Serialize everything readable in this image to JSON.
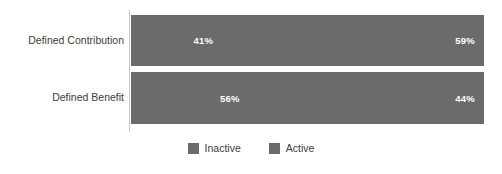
{
  "chart_data": {
    "type": "bar",
    "subtype": "stacked-horizontal-100-percent",
    "title": "",
    "subtitle": "",
    "xlabel": "",
    "ylabel": "",
    "xlim": [
      0,
      100
    ],
    "grid": false,
    "legend_position": "bottom-center",
    "categories": [
      "Defined Contribution",
      "Defined Benefit"
    ],
    "series": [
      {
        "name": "Inactive",
        "color": "#6b6b6b",
        "values": [
          41,
          56
        ],
        "labels": [
          "41%",
          "56%"
        ]
      },
      {
        "name": "Active",
        "color": "#6b6b6b",
        "values": [
          59,
          44
        ],
        "labels": [
          "59%",
          "44%"
        ]
      }
    ]
  },
  "axis": {
    "line_color": "#c9c9c9"
  },
  "category_labels": [
    {
      "text": "Defined Contribution"
    },
    {
      "text": "Defined Benefit"
    }
  ],
  "bars": [
    {
      "category": "Defined Contribution",
      "segments": [
        {
          "series": "Inactive",
          "value": 41,
          "label": "41%"
        },
        {
          "series": "Active",
          "value": 59,
          "label": "59%"
        }
      ]
    },
    {
      "category": "Defined Benefit",
      "segments": [
        {
          "series": "Inactive",
          "value": 56,
          "label": "56%"
        },
        {
          "series": "Active",
          "value": 44,
          "label": "44%"
        }
      ]
    }
  ],
  "legend": {
    "items": [
      {
        "label": "Inactive",
        "color": "#6b6b6b",
        "swatch_icon": "square-swatch-icon"
      },
      {
        "label": "Active",
        "color": "#6b6b6b",
        "swatch_icon": "square-swatch-icon"
      }
    ]
  },
  "colors": {
    "background": "#ffffff",
    "bar_fill": "#6b6b6b",
    "data_label_text": "#ffffff",
    "category_text": "#3d3d3d",
    "legend_text": "#3d3d3d",
    "axis_line": "#c9c9c9"
  }
}
